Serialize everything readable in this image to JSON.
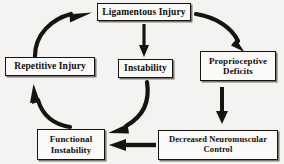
{
  "diagram": {
    "background_color": "#f4f3f1",
    "ink_color": "#16140f",
    "nodes": [
      {
        "id": "ligamentous-injury",
        "label": "Ligamentous Injury",
        "line1": "Ligamentous Injury",
        "line2": ""
      },
      {
        "id": "repetitive-injury",
        "label": "Repetitive Injury",
        "line1": "Repetitive Injury",
        "line2": ""
      },
      {
        "id": "instability",
        "label": "Instability",
        "line1": "Instability",
        "line2": ""
      },
      {
        "id": "proprioceptive-deficits",
        "label": "Proprioceptive Deficits",
        "line1": "Proprioceptive",
        "line2": "Deficits"
      },
      {
        "id": "functional-instability",
        "label": "Functional Instability",
        "line1": "Functional",
        "line2": "Instability"
      },
      {
        "id": "decreased-neuromuscular-control",
        "label": "Decreased Neuromuscular Control",
        "line1": "Decreased Neuromuscular",
        "line2": "Control"
      }
    ],
    "arrows": [
      {
        "id": "repetitive-injury-to-ligamentous-injury",
        "from": "repetitive-injury",
        "to": "ligamentous-injury",
        "style": "curved"
      },
      {
        "id": "ligamentous-injury-to-proprioceptive-deficits",
        "from": "ligamentous-injury",
        "to": "proprioceptive-deficits",
        "style": "curved"
      },
      {
        "id": "ligamentous-injury-to-instability",
        "from": "ligamentous-injury",
        "to": "instability",
        "style": "straight-vertical"
      },
      {
        "id": "proprioceptive-deficits-to-decreased-neuromuscular-control",
        "from": "proprioceptive-deficits",
        "to": "decreased-neuromuscular-control",
        "style": "straight-vertical"
      },
      {
        "id": "instability-to-functional-instability",
        "from": "instability",
        "to": "functional-instability",
        "style": "curved"
      },
      {
        "id": "decreased-neuromuscular-control-to-functional-instability",
        "from": "decreased-neuromuscular-control",
        "to": "functional-instability",
        "style": "straight-horizontal"
      },
      {
        "id": "functional-instability-to-repetitive-injury",
        "from": "functional-instability",
        "to": "repetitive-injury",
        "style": "curved"
      }
    ]
  }
}
